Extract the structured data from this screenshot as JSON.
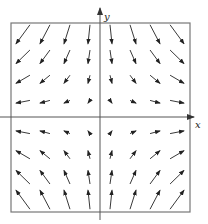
{
  "diagram": {
    "type": "vector-field",
    "axes": {
      "x_label": "x",
      "y_label": "y"
    },
    "field": "F(x,y) = <x, -y>",
    "grid": {
      "columns": [
        -3.5,
        -2.5,
        -1.5,
        -0.5,
        0.5,
        1.5,
        2.5,
        3.5
      ],
      "rows": [
        3.5,
        2.5,
        1.5,
        0.5,
        -0.5,
        -1.5,
        -2.5,
        -3.5
      ]
    },
    "colors": {
      "arrow": "#222222",
      "frame": "#777777",
      "axis": "#555555"
    }
  }
}
